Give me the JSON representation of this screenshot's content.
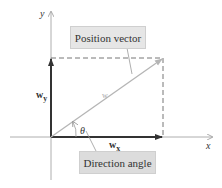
{
  "diagram": {
    "axes": {
      "x_label": "x",
      "y_label": "y"
    },
    "vector": {
      "label": "w",
      "color": "#b5b5b5"
    },
    "components": {
      "x_label": "w",
      "x_sub": "x",
      "y_label": "w",
      "y_sub": "y",
      "color": "#333333"
    },
    "angle": {
      "label": "θ"
    },
    "callouts": {
      "position": "Position vector",
      "direction": "Direction angle"
    },
    "colors": {
      "axis": "#999999",
      "dashed": "#777777",
      "callout_bg": "#e6e6e6"
    }
  }
}
